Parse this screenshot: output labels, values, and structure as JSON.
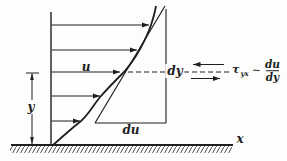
{
  "diagram": {
    "background": "#fdfdfc",
    "ink_color": "#1e1e1e",
    "labels": {
      "velocity": "u",
      "height": "y",
      "x_axis": "x",
      "du": "du",
      "dy": "dy"
    },
    "shear": {
      "tau": "τ",
      "tau_subscript": "yx",
      "relation": "∼",
      "fraction_numerator": "du",
      "fraction_denominator": "dy"
    }
  }
}
